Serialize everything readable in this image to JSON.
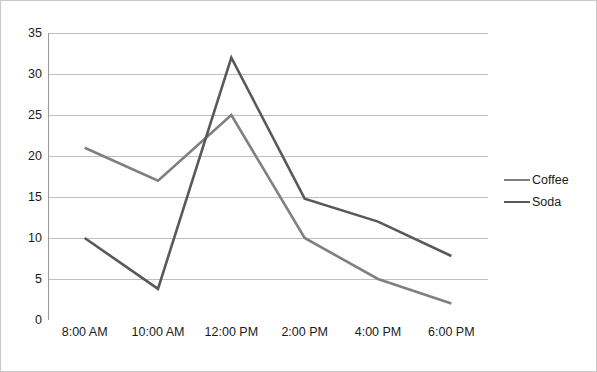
{
  "chart_data": {
    "type": "line",
    "title": "",
    "xlabel": "",
    "ylabel": "",
    "categories": [
      "8:00 AM",
      "10:00 AM",
      "12:00 PM",
      "2:00 PM",
      "4:00 PM",
      "6:00 PM"
    ],
    "series": [
      {
        "name": "Coffee",
        "color": "#808080",
        "values": [
          21,
          17,
          25,
          10,
          5,
          2
        ]
      },
      {
        "name": "Soda",
        "color": "#595959",
        "values": [
          10,
          3.8,
          32,
          14.8,
          12,
          7.8
        ]
      }
    ],
    "ylim": [
      0,
      35
    ],
    "y_ticks": [
      0,
      5,
      10,
      15,
      20,
      25,
      30,
      35
    ],
    "grid": "horizontal",
    "legend_position": "right",
    "colors": {
      "grid": "#bfbfbf",
      "axis": "#9a9a9a",
      "text": "#1a1a1a",
      "border": "#c8c8c8",
      "background": "#ffffff"
    }
  }
}
